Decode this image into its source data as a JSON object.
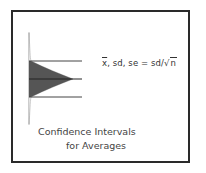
{
  "formula": {
    "xbar": "x",
    "rest": ",  sd,  se = sd/",
    "sqrt_symbol": "√",
    "sqrt_arg": "n"
  },
  "caption": {
    "line1": "Confidence Intervals",
    "line2": "for Averages"
  },
  "colors": {
    "frame": "#2a2a2a",
    "fill": "#555555",
    "lines": "#444444"
  }
}
